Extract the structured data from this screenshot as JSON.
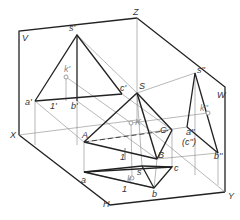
{
  "diagram": {
    "planes": {
      "V": "V",
      "W": "W",
      "H": "H"
    },
    "axes": {
      "X": "X",
      "Y": "Y",
      "Z": "Z"
    },
    "space_points": {
      "S": "S",
      "A": "A",
      "B": "B",
      "C": "C",
      "K": "K"
    },
    "front_view": {
      "s": "s'",
      "k": "k'",
      "a": "a'",
      "b": "b'",
      "c": "c'",
      "one": "1'"
    },
    "top_view": {
      "s": "s",
      "k": "k",
      "a": "a",
      "b": "b",
      "c": "c",
      "one": "1"
    },
    "side_view": {
      "s": "s''",
      "k": "k''",
      "a": "a''",
      "b": "b''",
      "c": "(c'')"
    },
    "aux": {
      "one_space": "1",
      "one_top": "1"
    },
    "colors": {
      "line": "#222222",
      "thin": "#555555",
      "light": "#aaaaaa"
    }
  }
}
